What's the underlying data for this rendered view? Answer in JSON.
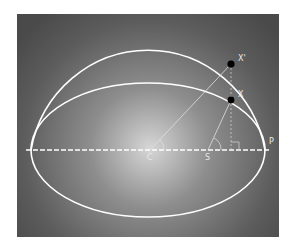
{
  "diagram": {
    "type": "kepler-eccentric-anomaly",
    "colors": {
      "background_center": "#d8d8d8",
      "background_edge": "#4a4a4a",
      "page": "#ffffff",
      "curve": "#ffffff",
      "point": "#000000",
      "label": "#e8e8e8"
    },
    "labels": {
      "center": "C",
      "focus": "S",
      "perihelion": "P",
      "planet": "X",
      "auxiliary_point": "X'"
    }
  }
}
